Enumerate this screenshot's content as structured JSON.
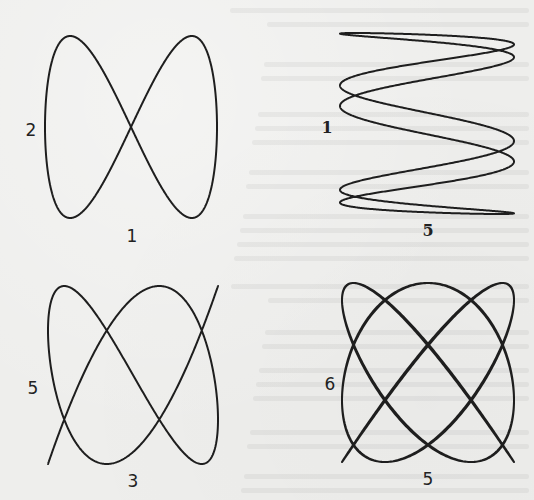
{
  "figure": {
    "background": "#eeeeec",
    "stroke": "#1e1e1e",
    "stroke_width": 2
  },
  "panels": [
    {
      "id": "panel-1",
      "left_label": "2",
      "bottom_label": "1",
      "freq_x": 1,
      "freq_y": 2,
      "phase": 0,
      "box": {
        "x0": 45,
        "x1": 217,
        "y0": 36,
        "y1": 218
      },
      "left_label_pos": {
        "x": 31,
        "y": 130
      },
      "bottom_label_pos": {
        "x": 132,
        "y": 236
      },
      "label_style": "sans"
    },
    {
      "id": "panel-2",
      "left_label": "1",
      "bottom_label": "5",
      "freq_x": 5,
      "freq_y": 1,
      "phase": 0.31,
      "box": {
        "x0": 340,
        "x1": 514,
        "y0": 33,
        "y1": 214
      },
      "left_label_pos": {
        "x": 327,
        "y": 128
      },
      "bottom_label_pos": {
        "x": 428,
        "y": 231
      },
      "label_style": "serif"
    },
    {
      "id": "panel-3",
      "left_label": "5",
      "bottom_label": "3",
      "freq_x": 3,
      "freq_y": 5,
      "phase": 0.1,
      "box": {
        "x0": 48,
        "x1": 218,
        "y0": 286,
        "y1": 464
      },
      "left_label_pos": {
        "x": 33,
        "y": 388
      },
      "bottom_label_pos": {
        "x": 133,
        "y": 481
      },
      "label_style": "sans"
    },
    {
      "id": "panel-4",
      "left_label": "6",
      "bottom_label": "5",
      "freq_x": 5,
      "freq_y": 6,
      "phase": 0.08,
      "box": {
        "x0": 342,
        "x1": 514,
        "y0": 283,
        "y1": 462
      },
      "left_label_pos": {
        "x": 330,
        "y": 384
      },
      "bottom_label_pos": {
        "x": 428,
        "y": 479
      },
      "label_style": "sans"
    }
  ]
}
